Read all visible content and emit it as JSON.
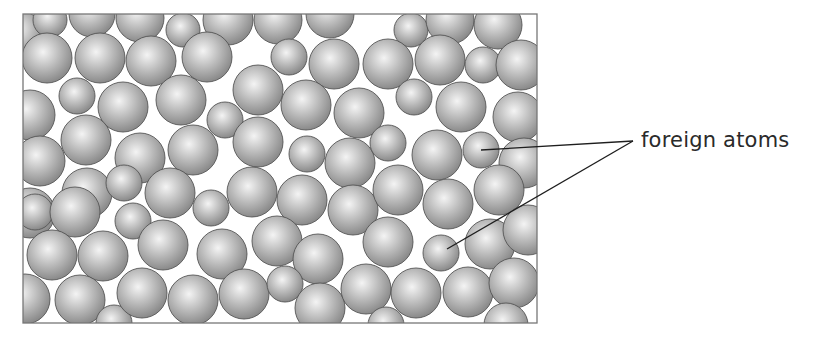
{
  "label": {
    "text": "foreign atoms",
    "anchor": [
      633,
      141
    ]
  },
  "colors": {
    "atom_highlight": "#f4f4f4",
    "atom_mid": "#b9b9b9",
    "atom_shadow": "#8a8a8a",
    "atom_outline": "#555555",
    "box_outline": "#777777",
    "leader_line": "#1e1e1e",
    "background": "#ffffff"
  },
  "box": {
    "x": 23,
    "y": 14,
    "width": 514,
    "height": 309
  },
  "leader_lines": [
    {
      "from": [
        633,
        141
      ],
      "to": [
        481,
        150
      ]
    },
    {
      "from": [
        633,
        141
      ],
      "to": [
        447,
        249
      ]
    }
  ],
  "foreign_atoms": [
    {
      "cx": 481,
      "cy": 150,
      "r": 18
    },
    {
      "cx": 441,
      "cy": 253,
      "r": 18
    }
  ],
  "host_atoms": [
    {
      "cx": 22,
      "cy": 34,
      "r": 22
    },
    {
      "cx": 50,
      "cy": 20,
      "r": 17
    },
    {
      "cx": 92,
      "cy": 14,
      "r": 23
    },
    {
      "cx": 140,
      "cy": 18,
      "r": 24
    },
    {
      "cx": 183,
      "cy": 30,
      "r": 17
    },
    {
      "cx": 228,
      "cy": 20,
      "r": 25
    },
    {
      "cx": 278,
      "cy": 20,
      "r": 24
    },
    {
      "cx": 330,
      "cy": 14,
      "r": 24
    },
    {
      "cx": 411,
      "cy": 30,
      "r": 17
    },
    {
      "cx": 450,
      "cy": 20,
      "r": 24
    },
    {
      "cx": 498,
      "cy": 25,
      "r": 24
    },
    {
      "cx": 47,
      "cy": 58,
      "r": 25
    },
    {
      "cx": 100,
      "cy": 58,
      "r": 25
    },
    {
      "cx": 151,
      "cy": 61,
      "r": 25
    },
    {
      "cx": 207,
      "cy": 57,
      "r": 25
    },
    {
      "cx": 289,
      "cy": 57,
      "r": 18
    },
    {
      "cx": 334,
      "cy": 64,
      "r": 25
    },
    {
      "cx": 388,
      "cy": 64,
      "r": 25
    },
    {
      "cx": 440,
      "cy": 60,
      "r": 25
    },
    {
      "cx": 483,
      "cy": 65,
      "r": 18
    },
    {
      "cx": 521,
      "cy": 65,
      "r": 25
    },
    {
      "cx": 30,
      "cy": 115,
      "r": 25
    },
    {
      "cx": 77,
      "cy": 96,
      "r": 18
    },
    {
      "cx": 123,
      "cy": 107,
      "r": 25
    },
    {
      "cx": 181,
      "cy": 100,
      "r": 25
    },
    {
      "cx": 225,
      "cy": 120,
      "r": 18
    },
    {
      "cx": 258,
      "cy": 90,
      "r": 25
    },
    {
      "cx": 306,
      "cy": 105,
      "r": 25
    },
    {
      "cx": 359,
      "cy": 113,
      "r": 25
    },
    {
      "cx": 414,
      "cy": 97,
      "r": 18
    },
    {
      "cx": 461,
      "cy": 107,
      "r": 25
    },
    {
      "cx": 518,
      "cy": 117,
      "r": 25
    },
    {
      "cx": 40,
      "cy": 161,
      "r": 25
    },
    {
      "cx": 86,
      "cy": 140,
      "r": 25
    },
    {
      "cx": 140,
      "cy": 158,
      "r": 25
    },
    {
      "cx": 193,
      "cy": 150,
      "r": 25
    },
    {
      "cx": 258,
      "cy": 142,
      "r": 25
    },
    {
      "cx": 307,
      "cy": 154,
      "r": 18
    },
    {
      "cx": 350,
      "cy": 163,
      "r": 25
    },
    {
      "cx": 388,
      "cy": 143,
      "r": 18
    },
    {
      "cx": 437,
      "cy": 155,
      "r": 25
    },
    {
      "cx": 524,
      "cy": 163,
      "r": 25
    },
    {
      "cx": 30,
      "cy": 213,
      "r": 25
    },
    {
      "cx": 87,
      "cy": 193,
      "r": 25
    },
    {
      "cx": 124,
      "cy": 183,
      "r": 18
    },
    {
      "cx": 170,
      "cy": 193,
      "r": 25
    },
    {
      "cx": 211,
      "cy": 208,
      "r": 18
    },
    {
      "cx": 252,
      "cy": 192,
      "r": 25
    },
    {
      "cx": 302,
      "cy": 200,
      "r": 25
    },
    {
      "cx": 353,
      "cy": 210,
      "r": 25
    },
    {
      "cx": 398,
      "cy": 190,
      "r": 25
    },
    {
      "cx": 448,
      "cy": 204,
      "r": 25
    },
    {
      "cx": 499,
      "cy": 190,
      "r": 25
    },
    {
      "cx": 35,
      "cy": 212,
      "r": 18
    },
    {
      "cx": 75,
      "cy": 212,
      "r": 25
    },
    {
      "cx": 133,
      "cy": 221,
      "r": 18
    },
    {
      "cx": 52,
      "cy": 255,
      "r": 25
    },
    {
      "cx": 103,
      "cy": 256,
      "r": 25
    },
    {
      "cx": 163,
      "cy": 245,
      "r": 25
    },
    {
      "cx": 222,
      "cy": 254,
      "r": 25
    },
    {
      "cx": 277,
      "cy": 241,
      "r": 25
    },
    {
      "cx": 318,
      "cy": 259,
      "r": 25
    },
    {
      "cx": 388,
      "cy": 242,
      "r": 25
    },
    {
      "cx": 490,
      "cy": 244,
      "r": 25
    },
    {
      "cx": 528,
      "cy": 230,
      "r": 25
    },
    {
      "cx": 25,
      "cy": 299,
      "r": 25
    },
    {
      "cx": 80,
      "cy": 300,
      "r": 25
    },
    {
      "cx": 114,
      "cy": 323,
      "r": 18
    },
    {
      "cx": 142,
      "cy": 293,
      "r": 25
    },
    {
      "cx": 193,
      "cy": 300,
      "r": 25
    },
    {
      "cx": 244,
      "cy": 294,
      "r": 25
    },
    {
      "cx": 285,
      "cy": 284,
      "r": 18
    },
    {
      "cx": 320,
      "cy": 308,
      "r": 25
    },
    {
      "cx": 366,
      "cy": 289,
      "r": 25
    },
    {
      "cx": 416,
      "cy": 293,
      "r": 25
    },
    {
      "cx": 468,
      "cy": 292,
      "r": 25
    },
    {
      "cx": 514,
      "cy": 283,
      "r": 25
    },
    {
      "cx": 386,
      "cy": 325,
      "r": 18
    },
    {
      "cx": 506,
      "cy": 325,
      "r": 22
    }
  ]
}
